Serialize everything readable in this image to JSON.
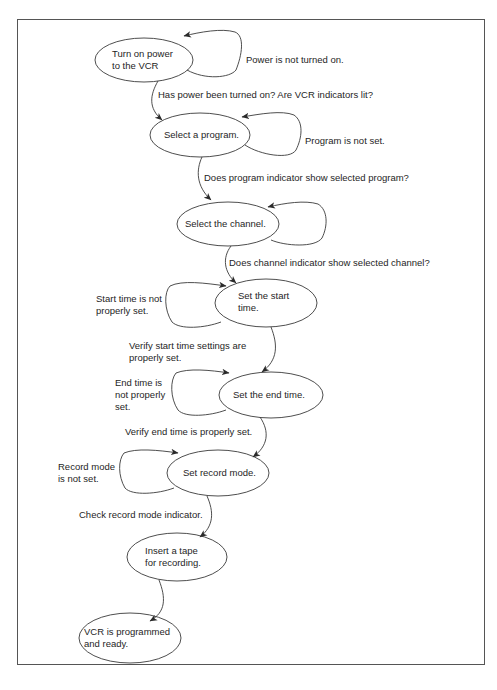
{
  "diagram": {
    "type": "state-flow",
    "colors": {
      "stroke": "#3a3a3a",
      "frame": "#555555",
      "text": "#1e1e1e",
      "background": "#ffffff"
    },
    "nodes": [
      {
        "id": "power",
        "lines": [
          "Turn on power",
          "to the VCR"
        ]
      },
      {
        "id": "program",
        "lines": [
          "Select a program."
        ]
      },
      {
        "id": "channel",
        "lines": [
          "Select the channel."
        ]
      },
      {
        "id": "start",
        "lines": [
          "Set the start",
          "time."
        ]
      },
      {
        "id": "end",
        "lines": [
          "Set the end time."
        ]
      },
      {
        "id": "record",
        "lines": [
          "Set record mode."
        ]
      },
      {
        "id": "tape",
        "lines": [
          "Insert a tape",
          "for recording."
        ]
      },
      {
        "id": "ready",
        "lines": [
          "VCR is programmed",
          "and ready."
        ]
      }
    ],
    "loops": [
      {
        "node": "power",
        "lines": [
          "Power is not turned on."
        ]
      },
      {
        "node": "program",
        "lines": [
          "Program is not set."
        ]
      },
      {
        "node": "channel",
        "lines": []
      },
      {
        "node": "start",
        "lines": [
          "Start time is not",
          "properly set."
        ]
      },
      {
        "node": "end",
        "lines": [
          "End time is",
          "not properly",
          "set."
        ]
      },
      {
        "node": "record",
        "lines": [
          "Record mode",
          "is not set."
        ]
      }
    ],
    "transitions": [
      {
        "from": "power",
        "to": "program",
        "lines": [
          "Has power been turned on? Are VCR indicators lit?"
        ]
      },
      {
        "from": "program",
        "to": "channel",
        "lines": [
          "Does program indicator show selected program?"
        ]
      },
      {
        "from": "channel",
        "to": "start",
        "lines": [
          "Does channel indicator show selected channel?"
        ]
      },
      {
        "from": "start",
        "to": "end",
        "lines": [
          "Verify start time settings are",
          "properly set."
        ]
      },
      {
        "from": "end",
        "to": "record",
        "lines": [
          "Verify end time is properly set."
        ]
      },
      {
        "from": "record",
        "to": "tape",
        "lines": [
          "Check record mode indicator."
        ]
      },
      {
        "from": "tape",
        "to": "ready",
        "lines": []
      }
    ]
  }
}
